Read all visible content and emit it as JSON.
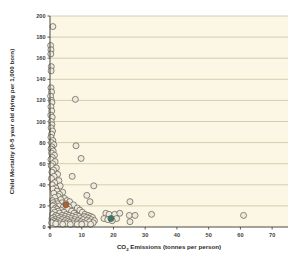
{
  "chart_data": {
    "type": "scatter",
    "title": "",
    "xlabel": "CO2 Emissions (tonnes per person)",
    "xlabel_main": "CO",
    "xlabel_sub": "2",
    "xlabel_rest": " Emissions (tonnes per person)",
    "ylabel": "Child Mortality (0-5 year old dying per 1,000 born)",
    "xlim": [
      0,
      75
    ],
    "ylim": [
      0,
      200
    ],
    "xticks": [
      0,
      10,
      20,
      30,
      40,
      50,
      60,
      70
    ],
    "yticks": [
      0,
      20,
      40,
      60,
      80,
      100,
      120,
      140,
      160,
      180,
      200
    ],
    "grid": "horizontal",
    "legend": "none",
    "marker": "open-circle",
    "plot_background": "#fbf7e4",
    "marker_fill": "#efeade",
    "marker_stroke": "#5d584c",
    "highlight_colors": {
      "orange": "#b5622c",
      "teal": "#2f7d6e"
    },
    "series": [
      {
        "name": "countries",
        "color": "#efeade",
        "points": [
          [
            0.9,
            190
          ],
          [
            0.2,
            172
          ],
          [
            0.3,
            168
          ],
          [
            0.25,
            164
          ],
          [
            0.4,
            152
          ],
          [
            0.35,
            148
          ],
          [
            0.3,
            132
          ],
          [
            0.5,
            128
          ],
          [
            0.2,
            124
          ],
          [
            0.45,
            120
          ],
          [
            0.6,
            118
          ],
          [
            8.0,
            121
          ],
          [
            0.3,
            114
          ],
          [
            0.55,
            110
          ],
          [
            0.25,
            106
          ],
          [
            0.7,
            104
          ],
          [
            0.4,
            100
          ],
          [
            0.6,
            97
          ],
          [
            0.35,
            94
          ],
          [
            0.8,
            91
          ],
          [
            0.5,
            88
          ],
          [
            0.3,
            85
          ],
          [
            0.9,
            82
          ],
          [
            0.45,
            80
          ],
          [
            1.2,
            78
          ],
          [
            0.6,
            76
          ],
          [
            0.35,
            74
          ],
          [
            8.2,
            77
          ],
          [
            1.0,
            72
          ],
          [
            0.5,
            70
          ],
          [
            1.4,
            68
          ],
          [
            0.7,
            66
          ],
          [
            0.3,
            64
          ],
          [
            9.8,
            65
          ],
          [
            1.6,
            62
          ],
          [
            0.8,
            60
          ],
          [
            0.4,
            58
          ],
          [
            2.0,
            56
          ],
          [
            1.1,
            54
          ],
          [
            0.6,
            52
          ],
          [
            2.4,
            50
          ],
          [
            1.3,
            48
          ],
          [
            0.45,
            46
          ],
          [
            7.0,
            48
          ],
          [
            2.8,
            44
          ],
          [
            1.5,
            42
          ],
          [
            0.7,
            40
          ],
          [
            3.2,
            39
          ],
          [
            1.8,
            37
          ],
          [
            0.9,
            36
          ],
          [
            2.2,
            34
          ],
          [
            4.0,
            33
          ],
          [
            1.2,
            32
          ],
          [
            3.0,
            31
          ],
          [
            13.8,
            39
          ],
          [
            11.6,
            30
          ],
          [
            2.6,
            29
          ],
          [
            1.5,
            28
          ],
          [
            4.6,
            27
          ],
          [
            3.4,
            26
          ],
          [
            0.8,
            25
          ],
          [
            5.4,
            25
          ],
          [
            2.0,
            24
          ],
          [
            6.2,
            24
          ],
          [
            1.0,
            23
          ],
          [
            3.8,
            23
          ],
          [
            12.6,
            24
          ],
          [
            25.2,
            24
          ],
          [
            2.4,
            22
          ],
          [
            5.0,
            22
          ],
          [
            1.3,
            21
          ],
          [
            7.4,
            21
          ],
          [
            3.0,
            20
          ],
          [
            0.9,
            20
          ],
          [
            6.0,
            19
          ],
          [
            4.2,
            19
          ],
          [
            1.7,
            18
          ],
          [
            8.6,
            18
          ],
          [
            2.2,
            17
          ],
          [
            5.6,
            17
          ],
          [
            3.4,
            16
          ],
          [
            9.4,
            16
          ],
          [
            1.1,
            16
          ],
          [
            6.8,
            15
          ],
          [
            2.6,
            15
          ],
          [
            4.4,
            14
          ],
          [
            10.2,
            14
          ],
          [
            1.5,
            14
          ],
          [
            7.6,
            13
          ],
          [
            3.0,
            13
          ],
          [
            5.2,
            12
          ],
          [
            11.0,
            12
          ],
          [
            0.8,
            12
          ],
          [
            8.2,
            11
          ],
          [
            3.8,
            11
          ],
          [
            6.0,
            11
          ],
          [
            12.0,
            11
          ],
          [
            1.9,
            11
          ],
          [
            17.6,
            13
          ],
          [
            18.6,
            12
          ],
          [
            20.4,
            12
          ],
          [
            22.0,
            13
          ],
          [
            25.0,
            11
          ],
          [
            26.8,
            11
          ],
          [
            32.0,
            12
          ],
          [
            61.0,
            11
          ],
          [
            2.4,
            10
          ],
          [
            4.8,
            10
          ],
          [
            7.0,
            10
          ],
          [
            9.0,
            10
          ],
          [
            10.8,
            10
          ],
          [
            12.8,
            10
          ],
          [
            1.2,
            9
          ],
          [
            3.4,
            9
          ],
          [
            5.8,
            9
          ],
          [
            8.0,
            9
          ],
          [
            11.4,
            9
          ],
          [
            13.4,
            9
          ],
          [
            0.6,
            8
          ],
          [
            2.8,
            8
          ],
          [
            4.4,
            8
          ],
          [
            6.6,
            8
          ],
          [
            9.6,
            8
          ],
          [
            12.2,
            8
          ],
          [
            17.0,
            8
          ],
          [
            21.0,
            8
          ],
          [
            1.6,
            7
          ],
          [
            3.8,
            7
          ],
          [
            5.4,
            7
          ],
          [
            7.8,
            7
          ],
          [
            10.4,
            7
          ],
          [
            13.0,
            7
          ],
          [
            18.2,
            7
          ],
          [
            0.9,
            6
          ],
          [
            2.6,
            6
          ],
          [
            4.8,
            6
          ],
          [
            6.8,
            6
          ],
          [
            8.8,
            6
          ],
          [
            11.6,
            6
          ],
          [
            14.0,
            6
          ],
          [
            19.6,
            6
          ],
          [
            1.4,
            5
          ],
          [
            3.2,
            5
          ],
          [
            5.6,
            5
          ],
          [
            7.4,
            5
          ],
          [
            9.8,
            5
          ],
          [
            12.4,
            5
          ],
          [
            25.2,
            5
          ],
          [
            2.0,
            4
          ],
          [
            4.2,
            4
          ],
          [
            6.2,
            4
          ],
          [
            8.4,
            4
          ],
          [
            10.6,
            4
          ],
          [
            13.6,
            4
          ],
          [
            0.5,
            4
          ],
          [
            3.0,
            3
          ],
          [
            5.0,
            3
          ],
          [
            7.2,
            3
          ],
          [
            9.2,
            3
          ],
          [
            11.2,
            3
          ],
          [
            1.8,
            3
          ],
          [
            4.0,
            2.5
          ],
          [
            6.4,
            2.5
          ],
          [
            8.6,
            2.5
          ],
          [
            10.0,
            2.5
          ],
          [
            12.8,
            2.5
          ]
        ]
      },
      {
        "name": "highlight-orange",
        "color": "#b5622c",
        "points": [
          [
            5.0,
            21
          ]
        ]
      },
      {
        "name": "highlight-teal",
        "color": "#2f7d6e",
        "points": [
          [
            19.2,
            8
          ]
        ]
      }
    ]
  }
}
